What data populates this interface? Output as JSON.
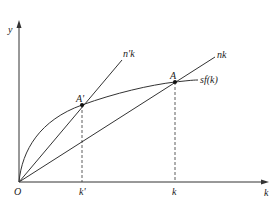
{
  "diagram": {
    "title": "",
    "axes": {
      "y_label": "y",
      "x_label": "k",
      "origin_label": "O"
    },
    "curves": [
      {
        "name": "n'k",
        "label": "n'k",
        "type": "line through origin (steeper)"
      },
      {
        "name": "nk",
        "label": "nk",
        "type": "line through origin"
      },
      {
        "name": "sf(k)",
        "label": "sf(k)",
        "type": "concave curve"
      }
    ],
    "points": [
      {
        "label": "A'",
        "description": "intersection of n'k and sf(k)"
      },
      {
        "label": "A",
        "description": "intersection of nk and sf(k)"
      }
    ],
    "x_ticks": [
      "k'",
      "k"
    ],
    "colors": {
      "line": "#333333",
      "background": "#ffffff"
    }
  }
}
